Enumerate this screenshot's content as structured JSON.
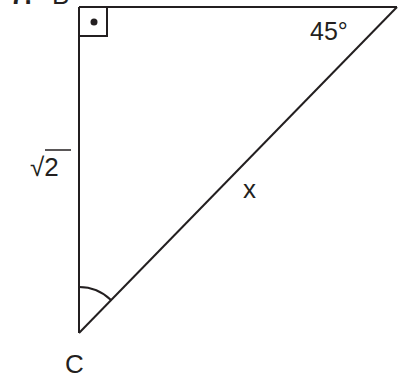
{
  "problem": {
    "number": "7.",
    "vertex_top_left": "B",
    "vertex_bottom": "C",
    "angle_top_right": "45°",
    "side_left": "√2",
    "side_hypotenuse": "x",
    "right_angle_marker": "right-angle-box-with-dot",
    "angle_marker_at_C": "arc"
  },
  "colors": {
    "stroke": "#231f20",
    "background": "#ffffff"
  }
}
